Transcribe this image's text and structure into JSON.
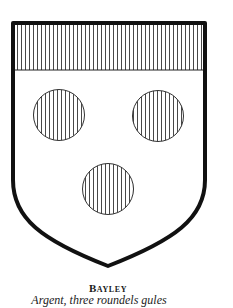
{
  "figure": {
    "arms_name": "Bayley",
    "blazon": "Argent, three roundels gules"
  },
  "shield": {
    "field_tincture": "argent",
    "chief_tincture": "gules",
    "charge": "roundel",
    "charge_count": 3,
    "charge_tincture": "gules",
    "colors": {
      "outline": "#111111",
      "field": "#ffffff",
      "hatching": "#333333"
    }
  }
}
